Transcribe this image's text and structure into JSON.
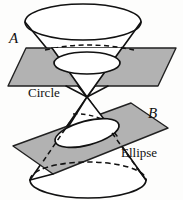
{
  "figure": {
    "background_color": "#fdfdfc",
    "ink_color": "#111111",
    "plane_fill_color": "#b0b0b0",
    "plane_stroke_color": "#1a1a1a",
    "cone_fill_color": "#ffffff",
    "cross_section_fill_color": "#ffffff",
    "labels": {
      "plane_a": "A",
      "plane_b": "B",
      "section_circle": "Circle",
      "section_ellipse": "Ellipse"
    },
    "elements": {
      "upper_nappe": "upper-cone-nappe",
      "lower_nappe": "lower-cone-nappe",
      "top_rim": "top-cone-rim-ellipse",
      "bottom_rim": "bottom-cone-rim-ellipse",
      "plane_a_name": "horizontal-cutting-plane-a",
      "plane_b_name": "tilted-cutting-plane-b",
      "circle_section": "circle-cross-section",
      "ellipse_section": "ellipse-cross-section"
    },
    "geometry": {
      "apex_x": 87,
      "apex_y": 97,
      "top_rim_center": [
        83,
        22
      ],
      "top_rim_radius": [
        58,
        18
      ],
      "bottom_rim_center": [
        88,
        180
      ],
      "bottom_rim_radius": [
        58,
        18
      ],
      "circle_section_center": [
        87,
        63
      ],
      "circle_section_radius": [
        33,
        11
      ],
      "ellipse_section_center": [
        87,
        133
      ],
      "ellipse_section_radius": [
        32,
        12
      ]
    }
  }
}
